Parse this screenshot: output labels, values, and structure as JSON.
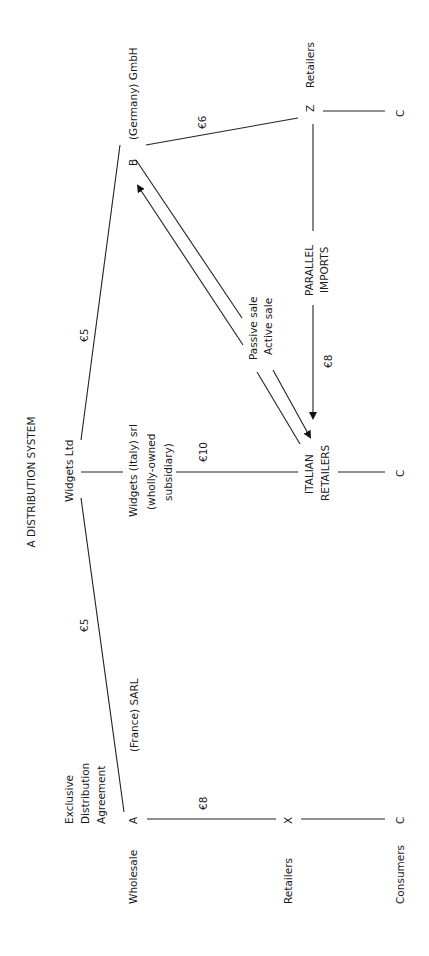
{
  "title": "A DISTRIBUTION SYSTEM",
  "orientation": "rotated -90deg (read bottom-to-top)",
  "nodes": {
    "supplier": "Widgets Ltd",
    "france_distributor_letter": "A",
    "france_distributor": "(France) SARL",
    "exclusive_agreement": [
      "Exclusive",
      "Distribution",
      "Agreement"
    ],
    "germany_distributor_letter": "B",
    "germany_distributor": "(Germany) GmbH",
    "italy_subsidiary": [
      "Widgets (Italy) srl",
      "(wholly-owned",
      "subsidiary)"
    ],
    "italian_retailers": [
      "ITALIAN",
      "RETAILERS"
    ],
    "french_retailer": "X",
    "german_retailer": "Z",
    "german_retailers_label": "Retailers",
    "consumer_a": "C",
    "consumer_b": "C",
    "consumer_c": "C",
    "parallel_imports": [
      "PARALLEL",
      "IMPORTS"
    ],
    "passive_sale": "Passive sale",
    "active_sale": "Active sale"
  },
  "prices": {
    "widgets_to_france": "€5",
    "widgets_to_germany": "€5",
    "widgets_italy_to_retailers": "€10",
    "france_to_retailers": "€8",
    "germany_to_retailers": "€6",
    "parallel_import_price": "€8"
  },
  "row_labels": {
    "wholesale": "Wholesale",
    "retailers": "Retailers",
    "consumers": "Consumers"
  }
}
